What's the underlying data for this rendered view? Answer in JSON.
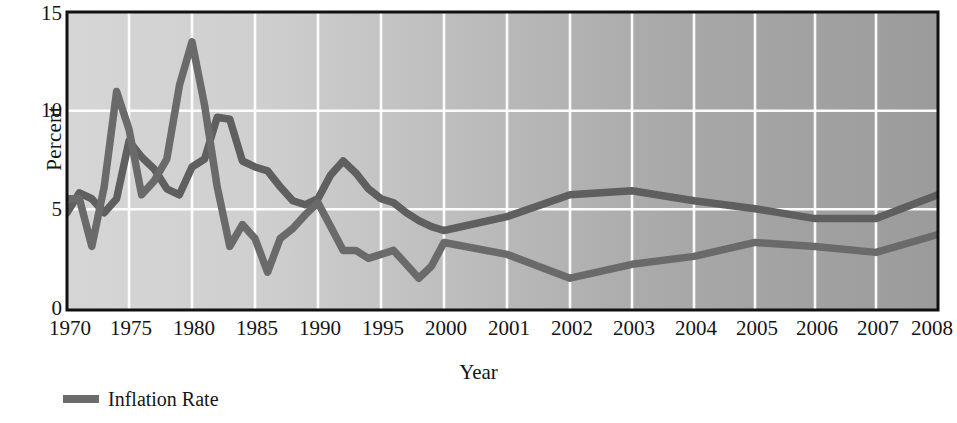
{
  "chart_data": {
    "type": "line",
    "title": "",
    "xlabel": "Year",
    "ylabel": "Percent",
    "ylim": [
      0,
      15
    ],
    "yticks": [
      0,
      5,
      10,
      15
    ],
    "grid": true,
    "legend_position": "below-left",
    "x_tick_labels": [
      "1970",
      "1975",
      "1980",
      "1985",
      "1990",
      "1995",
      "2000",
      "2001",
      "2002",
      "2003",
      "2004",
      "2005",
      "2006",
      "2007",
      "2008"
    ],
    "x": [
      1970,
      1971,
      1972,
      1973,
      1974,
      1975,
      1976,
      1977,
      1978,
      1979,
      1980,
      1981,
      1982,
      1983,
      1984,
      1985,
      1986,
      1987,
      1988,
      1989,
      1990,
      1991,
      1992,
      1993,
      1994,
      1995,
      1996,
      1997,
      1998,
      1999,
      2000,
      2001,
      2002,
      2003,
      2004,
      2005,
      2006,
      2007,
      2008
    ],
    "series": [
      {
        "name": "Inflation Rate",
        "color": "#6b6b6b",
        "values": [
          5.6,
          5.6,
          3.2,
          6.2,
          11.0,
          9.1,
          5.8,
          6.5,
          7.6,
          11.3,
          13.5,
          10.3,
          6.2,
          3.2,
          4.3,
          3.6,
          1.9,
          3.6,
          4.1,
          4.8,
          5.4,
          4.2,
          3.0,
          3.0,
          2.6,
          2.8,
          3.0,
          2.3,
          1.6,
          2.2,
          3.4,
          2.8,
          1.6,
          2.3,
          2.7,
          3.4,
          3.2,
          2.9,
          3.8
        ]
      },
      {
        "name": "Unemployment Rate",
        "color": "#5e5e5e",
        "values": [
          4.9,
          5.9,
          5.6,
          4.9,
          5.6,
          8.5,
          7.7,
          7.1,
          6.1,
          5.8,
          7.2,
          7.6,
          9.7,
          9.6,
          7.5,
          7.2,
          7.0,
          6.2,
          5.5,
          5.3,
          5.6,
          6.8,
          7.5,
          6.9,
          6.1,
          5.6,
          5.4,
          4.9,
          4.5,
          4.2,
          4.0,
          4.7,
          5.8,
          6.0,
          5.5,
          5.1,
          4.6,
          4.6,
          5.8
        ]
      }
    ]
  },
  "legend": {
    "items": [
      {
        "label": "Inflation Rate",
        "color": "#6b6b6b"
      }
    ]
  }
}
